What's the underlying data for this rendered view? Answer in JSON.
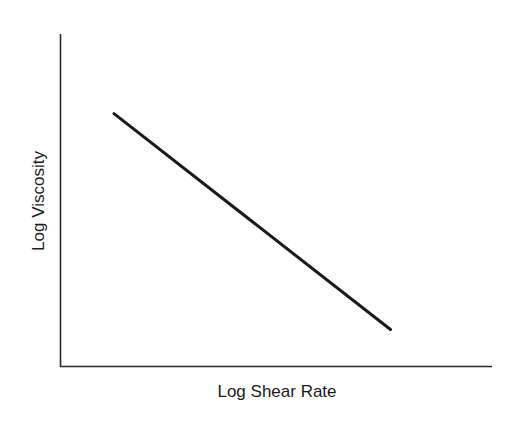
{
  "chart_data": {
    "type": "line",
    "title": "",
    "xlabel": "Log Shear Rate",
    "ylabel": "Log Viscosity",
    "grid": false,
    "legend": null,
    "ticks": {
      "x": [],
      "y": []
    },
    "series": [
      {
        "name": "viscosity vs shear rate",
        "description": "straight line with negative slope (shear-thinning, power-law behavior)",
        "points": [
          {
            "x": 0.125,
            "y": 0.76
          },
          {
            "x": 0.765,
            "y": 0.11
          }
        ],
        "color": "#1a1a1a"
      }
    ],
    "xlim": [
      0,
      1
    ],
    "ylim": [
      0,
      1
    ]
  },
  "colors": {
    "axis": "#2a2a2a",
    "line": "#1a1a1a",
    "background": "#ffffff"
  }
}
